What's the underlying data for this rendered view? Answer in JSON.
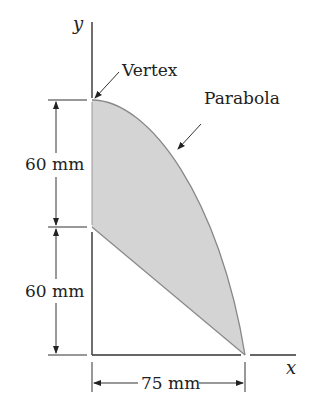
{
  "figure": {
    "axes": {
      "x_label": "x",
      "y_label": "y"
    },
    "labels": {
      "vertex": "Vertex",
      "parabola": "Parabola"
    },
    "dimensions": {
      "upper_vertical": "60 mm",
      "lower_vertical": "60 mm",
      "horizontal": "75 mm"
    },
    "colors": {
      "fill": "#d4d4d4",
      "stroke": "#333333",
      "curve": "#777777"
    }
  }
}
